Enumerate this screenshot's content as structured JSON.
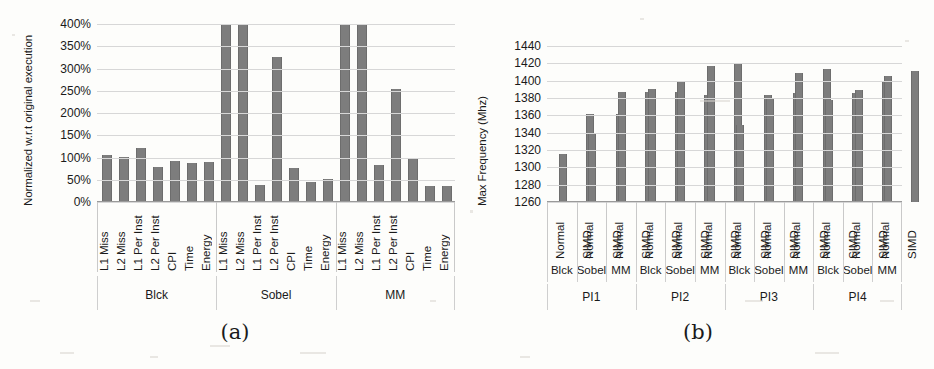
{
  "figure": {
    "background_color": "#fdfdfb",
    "bar_color": "#7d7d7d",
    "grid_color": "#d7d7d7"
  },
  "chart_data": [
    {
      "id": "a",
      "type": "bar",
      "caption": "(a)",
      "title": "",
      "xlabel": "",
      "ylabel": "Normalized w.r.t original execution",
      "ylim": [
        0,
        400
      ],
      "yticks": [
        "0%",
        "50%",
        "100%",
        "150%",
        "200%",
        "250%",
        "300%",
        "350%",
        "400%"
      ],
      "ytick_values": [
        0,
        50,
        100,
        150,
        200,
        250,
        300,
        350,
        400
      ],
      "grid": true,
      "legend": "none",
      "categories": [
        "L1 Miss",
        "L2 Miss",
        "L1 Per Inst",
        "L2 Per Inst",
        "CPI",
        "Time",
        "Energy"
      ],
      "groups": [
        {
          "name": "Blck",
          "values": [
            105,
            101,
            121,
            78,
            93,
            88,
            90
          ]
        },
        {
          "name": "Sobel",
          "values": [
            400,
            400,
            39,
            325,
            76,
            45,
            51
          ]
        },
        {
          "name": "MM",
          "values": [
            400,
            400,
            84,
            255,
            97,
            35,
            35
          ]
        }
      ],
      "clipped_note": "bars at 400% are clipped at the axis maximum"
    },
    {
      "id": "b",
      "type": "bar",
      "caption": "(b)",
      "title": "",
      "xlabel": "",
      "ylabel": "Max Frequency (Mhz)",
      "ylim": [
        1260,
        1440
      ],
      "yticks": [
        "1260",
        "1280",
        "1300",
        "1320",
        "1340",
        "1360",
        "1380",
        "1400",
        "1420",
        "1440"
      ],
      "ytick_values": [
        1260,
        1280,
        1300,
        1320,
        1340,
        1360,
        1380,
        1400,
        1420,
        1440
      ],
      "grid": true,
      "legend": "none",
      "categories": [
        "Normal",
        "SIMD"
      ],
      "benchmarks": [
        "Blck",
        "Sobel",
        "MM"
      ],
      "supergroups": [
        "PI1",
        "PI2",
        "PI3",
        "PI4"
      ],
      "groups": [
        {
          "name": "PI1",
          "benchmarks": [
            {
              "name": "Blck",
              "values": [
                1315,
                1362
              ]
            },
            {
              "name": "Sobel",
              "values": [
                1340,
                1362
              ]
            },
            {
              "name": "MM",
              "values": [
                1387,
                1387
              ]
            }
          ]
        },
        {
          "name": "PI2",
          "benchmarks": [
            {
              "name": "Blck",
              "values": [
                1390,
                1387
              ]
            },
            {
              "name": "Sobel",
              "values": [
                1400,
                1383
              ]
            },
            {
              "name": "MM",
              "values": [
                1417,
                1420
              ]
            }
          ]
        },
        {
          "name": "PI3",
          "benchmarks": [
            {
              "name": "Blck",
              "values": [
                1349,
                1383
              ]
            },
            {
              "name": "Sobel",
              "values": [
                1380,
                1386
              ]
            },
            {
              "name": "MM",
              "values": [
                1409,
                1414
              ]
            }
          ]
        },
        {
          "name": "PI4",
          "benchmarks": [
            {
              "name": "Blck",
              "values": [
                1378,
                1386
              ]
            },
            {
              "name": "Sobel",
              "values": [
                1389,
                1400
              ]
            },
            {
              "name": "MM",
              "values": [
                1405,
                1411
              ]
            }
          ]
        }
      ]
    }
  ]
}
